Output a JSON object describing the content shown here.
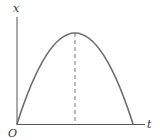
{
  "diagram": {
    "axes": {
      "y_label": "x",
      "x_label": "t",
      "origin_label": "O"
    },
    "curve": {
      "shape": "parabola",
      "description": "downward-opening parabola starting at origin, rising to a maximum, then returning to the t-axis",
      "start": [
        17,
        124
      ],
      "peak": [
        75,
        33
      ],
      "end": [
        133,
        124
      ]
    },
    "dashed_line": {
      "description": "vertical dashed line from the peak down to the t-axis",
      "from": [
        75,
        33
      ],
      "to": [
        75,
        124
      ]
    },
    "colors": {
      "axis": "#555555",
      "curve": "#6b6b6b",
      "dashed": "#777777",
      "text": "#333333"
    }
  }
}
